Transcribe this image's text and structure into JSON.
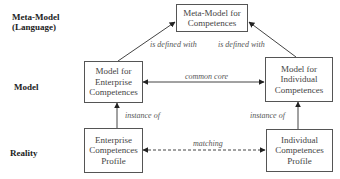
{
  "row_labels": {
    "meta_model": [
      "Meta-Model",
      "(Language)"
    ],
    "model": "Model",
    "reality": "Reality"
  },
  "boxes": {
    "meta_model": [
      "Meta-Model for",
      "Competences"
    ],
    "enterprise_model": [
      "Model for",
      "Enterprise",
      "Competences"
    ],
    "individual_model": [
      "Model for",
      "Individual",
      "Competences"
    ],
    "enterprise_profile": [
      "Enterprise",
      "Competences",
      "Profile"
    ],
    "individual_profile": [
      "Individual",
      "Competences",
      "Profile"
    ]
  },
  "relations": {
    "enterprise_defined": "is defined with",
    "individual_defined": "is defined with",
    "common_core": "common core",
    "enterprise_instance": "instance of",
    "individual_instance": "instance of",
    "matching": "matching"
  },
  "colors": {
    "line": "#444444",
    "box_border": "#555555",
    "text": "#444444"
  }
}
